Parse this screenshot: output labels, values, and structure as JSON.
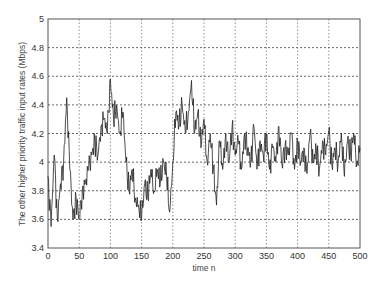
{
  "chart_data": {
    "type": "line",
    "title": "",
    "xlabel": "time n",
    "ylabel": "The other higher priority traffic input rates (Mbps)",
    "xlim": [
      0,
      500
    ],
    "ylim": [
      3.4,
      5.0
    ],
    "xticks": [
      0,
      50,
      100,
      150,
      200,
      250,
      300,
      350,
      400,
      450,
      500
    ],
    "yticks": [
      3.4,
      3.6,
      3.8,
      4.0,
      4.2,
      4.4,
      4.6,
      4.8,
      5.0
    ],
    "xtick_labels": [
      "0",
      "50",
      "100",
      "150",
      "200",
      "250",
      "300",
      "350",
      "400",
      "450",
      "500"
    ],
    "ytick_labels": [
      "3.4",
      "3.6",
      "3.8",
      "4",
      "4.2",
      "4.4",
      "4.6",
      "4.8",
      "5"
    ],
    "grid": true,
    "grid_style": "dotted",
    "legend": null,
    "series": [
      {
        "name": "input rate",
        "x_step": 5,
        "x_start": 0,
        "values": [
          3.9,
          3.55,
          4.05,
          3.6,
          3.85,
          4.0,
          4.45,
          3.95,
          3.6,
          3.75,
          3.6,
          3.8,
          3.85,
          3.95,
          4.05,
          4.15,
          4.05,
          4.25,
          4.3,
          4.2,
          4.58,
          4.3,
          4.4,
          4.2,
          4.35,
          4.0,
          3.8,
          3.95,
          3.75,
          3.7,
          3.6,
          3.85,
          3.75,
          3.95,
          3.8,
          3.95,
          3.85,
          4.0,
          3.9,
          3.65,
          4.0,
          4.35,
          4.25,
          4.4,
          4.2,
          4.35,
          4.57,
          4.2,
          4.35,
          4.1,
          4.3,
          4.0,
          4.2,
          3.95,
          3.7,
          4.15,
          3.95,
          4.2,
          4.0,
          4.25,
          4.05,
          4.15,
          3.95,
          4.2,
          4.1,
          4.0,
          4.25,
          3.95,
          4.15,
          4.05,
          4.2,
          3.95,
          4.1,
          4.0,
          4.25,
          3.98,
          4.12,
          4.05,
          4.2,
          3.95,
          4.15,
          4.0,
          4.1,
          3.92,
          4.2,
          4.0,
          4.1,
          3.95,
          4.15,
          4.05,
          4.22,
          3.98,
          4.1,
          4.0,
          4.2,
          3.9,
          4.15,
          4.05,
          4.2,
          4.0,
          4.1
        ]
      }
    ]
  }
}
